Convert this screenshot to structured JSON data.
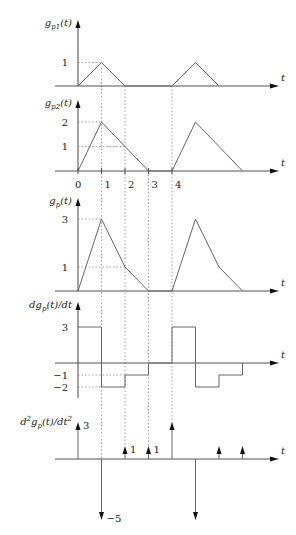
{
  "figure": {
    "x_axis_label": "t",
    "unit_px": 23.5,
    "origin_x": 78,
    "axis_end_x": 279,
    "plots": [
      {
        "id": "gp1",
        "label": "g_{p1}(t)",
        "label_main": "g",
        "label_sub": "p1",
        "label_tail": "(t)",
        "baseline_y": 86,
        "axis_top": 20,
        "scale": 23.5,
        "y_ticks": [
          {
            "value": 1,
            "label": "1"
          }
        ],
        "points": [
          [
            0,
            0
          ],
          [
            1,
            1
          ],
          [
            2,
            0
          ],
          [
            4,
            0
          ],
          [
            5,
            1
          ],
          [
            6,
            0
          ]
        ],
        "guides": [
          {
            "t": 1,
            "v": 1
          }
        ]
      },
      {
        "id": "gp2",
        "label": "g_{p2}(t)",
        "label_main": "g",
        "label_sub": "p2",
        "label_tail": "(t)",
        "baseline_y": 171,
        "axis_top": 100,
        "scale": 24.5,
        "y_ticks": [
          {
            "value": 2,
            "label": "2"
          },
          {
            "value": 1,
            "label": "1"
          }
        ],
        "points": [
          [
            0,
            0
          ],
          [
            1,
            2
          ],
          [
            3,
            0
          ],
          [
            4,
            0
          ],
          [
            5,
            2
          ],
          [
            7,
            0
          ]
        ],
        "guides": [
          {
            "t": 1,
            "v": 2
          },
          {
            "t": 2,
            "v": 1
          }
        ],
        "x_ticks": [
          {
            "t": 0,
            "label": "0"
          },
          {
            "t": 1,
            "label": "1"
          },
          {
            "t": 2,
            "label": "2"
          },
          {
            "t": 3,
            "label": "3"
          },
          {
            "t": 4,
            "label": "4"
          }
        ]
      },
      {
        "id": "gp",
        "label": "g_p(t)",
        "label_main": "g",
        "label_sub": "p",
        "label_tail": "(t)",
        "baseline_y": 291,
        "axis_top": 198,
        "scale": 24,
        "y_ticks": [
          {
            "value": 3,
            "label": "3"
          },
          {
            "value": 1,
            "label": "1"
          }
        ],
        "points": [
          [
            0,
            0
          ],
          [
            1,
            3
          ],
          [
            2,
            1
          ],
          [
            3,
            0
          ],
          [
            4,
            0
          ],
          [
            5,
            3
          ],
          [
            6,
            1
          ],
          [
            7,
            0
          ]
        ],
        "guides": [
          {
            "t": 1,
            "v": 3
          },
          {
            "t": 2,
            "v": 1
          }
        ]
      },
      {
        "id": "dgp",
        "label": "dg_p(t)/dt",
        "label_main": "dg",
        "label_sub": "p",
        "label_tail": "(t)/dt",
        "baseline_y": 363,
        "axis_top": 302,
        "axis_bottom": 398,
        "scale": 12,
        "y_ticks": [
          {
            "value": 3,
            "label": "3"
          },
          {
            "value": -1,
            "label": "−1"
          },
          {
            "value": -2,
            "label": "−2"
          }
        ],
        "points": [
          [
            0,
            3
          ],
          [
            1,
            3
          ],
          [
            1,
            -2
          ],
          [
            2,
            -2
          ],
          [
            2,
            -1
          ],
          [
            3,
            -1
          ],
          [
            3,
            0
          ],
          [
            4,
            0
          ],
          [
            4,
            3
          ],
          [
            5,
            3
          ],
          [
            5,
            -2
          ],
          [
            6,
            -2
          ],
          [
            6,
            -1
          ],
          [
            7,
            -1
          ],
          [
            7,
            0
          ]
        ],
        "guides": [
          {
            "t": 2,
            "v": -1
          },
          {
            "t": 1,
            "v": -2
          }
        ]
      },
      {
        "id": "d2gp",
        "label": "d²g_p(t)/dt²",
        "label_main": "d",
        "label_sup": "2",
        "label_mid": "g",
        "label_sub": "p",
        "label_tail": "(t)/dt",
        "label_sup2": "2",
        "baseline_y": 459,
        "impulses": [
          {
            "t": 0,
            "h": 37,
            "label": "3"
          },
          {
            "t": 1,
            "h": -61,
            "label": "−5"
          },
          {
            "t": 2,
            "h": 13,
            "label": "1"
          },
          {
            "t": 3,
            "h": 13,
            "label": "1"
          },
          {
            "t": 4,
            "h": 37,
            "label": ""
          },
          {
            "t": 5,
            "h": -61,
            "label": ""
          },
          {
            "t": 6,
            "h": 13,
            "label": ""
          },
          {
            "t": 7,
            "h": 13,
            "label": ""
          }
        ]
      }
    ],
    "vertical_dotted_lines": [
      {
        "t": 1,
        "y_from": 68,
        "y_to": 459
      },
      {
        "t": 2,
        "y_from": 86,
        "y_to": 446
      },
      {
        "t": 3,
        "y_from": 171,
        "y_to": 446
      },
      {
        "t": 4,
        "y_from": 86,
        "y_to": 430
      }
    ]
  }
}
